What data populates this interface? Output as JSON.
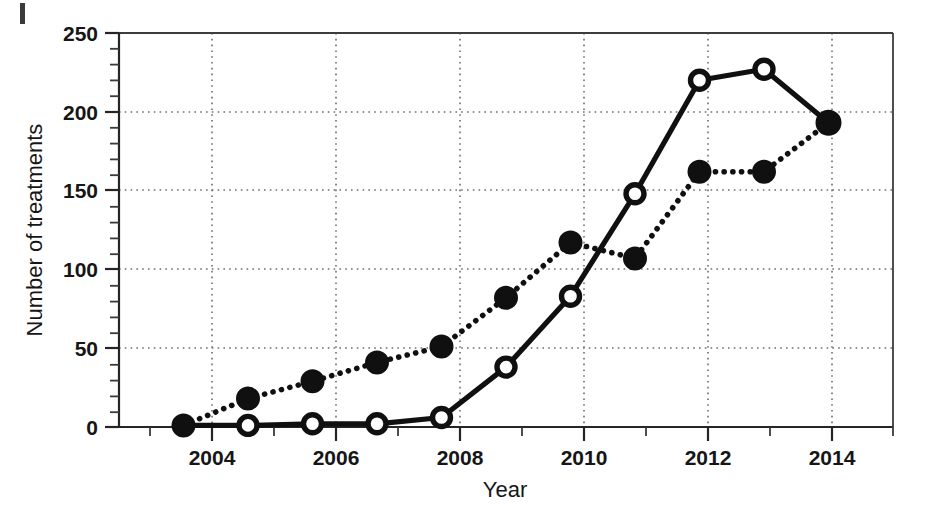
{
  "chart_data": {
    "type": "line",
    "title": "",
    "xlabel": "Year",
    "ylabel": "Number of treatments",
    "x": [
      2004,
      2005,
      2006,
      2007,
      2008,
      2009,
      2010,
      2011,
      2012,
      2013,
      2014
    ],
    "xlim": [
      2003,
      2015
    ],
    "ylim": [
      0,
      250
    ],
    "x_ticks": [
      2004,
      2006,
      2008,
      2010,
      2012,
      2014
    ],
    "x_tick_labels": [
      "2004",
      "2006",
      "2008",
      "2010",
      "2012",
      "2014"
    ],
    "x_minor_ticks": [
      2003,
      2005,
      2007,
      2009,
      2011,
      2013,
      2015
    ],
    "y_ticks": [
      0,
      50,
      100,
      150,
      200,
      250
    ],
    "y_tick_labels": [
      "0",
      "50",
      "100",
      "150",
      "200",
      "250"
    ],
    "y_minor_tick_step": 10,
    "grid": {
      "x_gridlines": [
        2004,
        2006,
        2008,
        2010,
        2012,
        2014
      ],
      "y_gridlines": [
        50,
        100,
        150,
        200
      ],
      "style": "dotted"
    },
    "legend": {
      "position": "none",
      "entries": []
    },
    "series": [
      {
        "name": "dotted-filled-circle-series",
        "marker": "filled-circle",
        "line_style": "dotted",
        "values": [
          1,
          18,
          29,
          41,
          51,
          82,
          117,
          107,
          162,
          162,
          193
        ]
      },
      {
        "name": "solid-open-circle-series",
        "marker": "open-circle",
        "line_style": "solid",
        "values": [
          1,
          1,
          2,
          2,
          6,
          38,
          83,
          148,
          220,
          227,
          193
        ]
      }
    ],
    "colors": {
      "line": "#101010",
      "grid": "#6d6d6d",
      "axis": "#252525",
      "background": "#ffffff"
    }
  },
  "axis": {
    "y_title": "Number of treatments",
    "x_title": "Year",
    "y_labels": [
      "250",
      "200",
      "150",
      "100",
      "50",
      "0"
    ],
    "x_labels": [
      "2004",
      "2006",
      "2008",
      "2010",
      "2012",
      "2014"
    ]
  }
}
